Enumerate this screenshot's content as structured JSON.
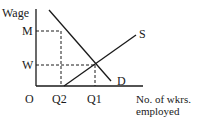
{
  "diagram": {
    "type": "supply-demand labour market",
    "y_axis_label": "Wage",
    "x_axis_label_line1": "No. of wkrs.",
    "x_axis_label_line2": "employed",
    "origin_label": "O",
    "y_ticks": [
      {
        "label": "M"
      },
      {
        "label": "W"
      }
    ],
    "x_ticks": [
      {
        "label": "Q2"
      },
      {
        "label": "Q1"
      }
    ],
    "curves": [
      {
        "name": "Supply",
        "label": "S"
      },
      {
        "name": "Demand",
        "label": "D"
      }
    ],
    "line_color": "#1a1a1a"
  }
}
